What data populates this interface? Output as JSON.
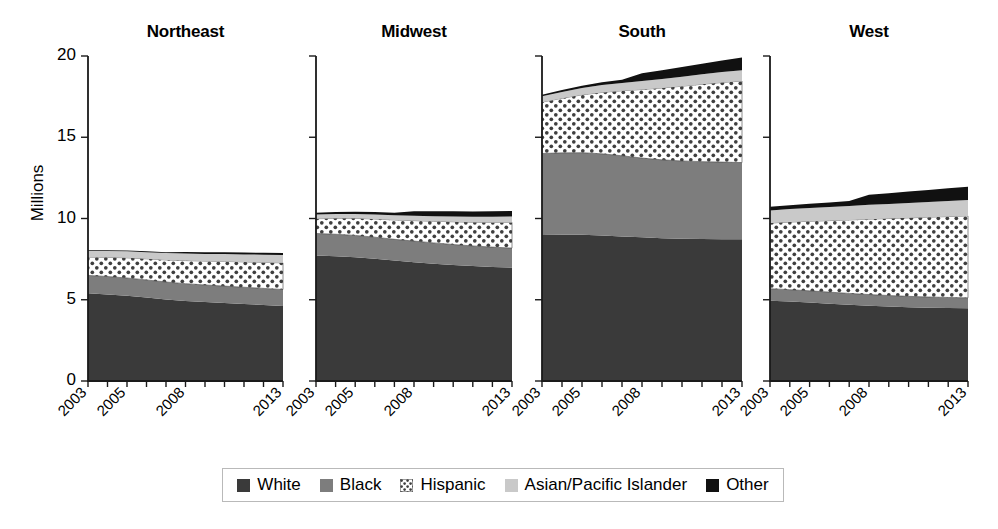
{
  "chart_data": {
    "type": "area",
    "title": "",
    "subtitle": "",
    "xlabel": "",
    "ylabel": "Millions",
    "ylim": [
      0,
      20
    ],
    "yticks": [
      0,
      5,
      10,
      15,
      20
    ],
    "grid": false,
    "legend_position": "bottom",
    "x": [
      2003,
      2004,
      2005,
      2006,
      2007,
      2008,
      2009,
      2010,
      2011,
      2012,
      2013
    ],
    "xtick_labels": [
      "2003",
      "2005",
      "2008",
      "2013"
    ],
    "xtick_label_years": [
      2003,
      2005,
      2008,
      2013
    ],
    "series_names": [
      "White",
      "Black",
      "Hispanic",
      "Asian/Pacific Islander",
      "Other"
    ],
    "series_colors": [
      "#3a3a3a",
      "#7d7d7d",
      "#ffffff",
      "#c9c9c9",
      "#111111"
    ],
    "series_patterns": [
      "solid",
      "solid",
      "dots",
      "solid",
      "solid"
    ],
    "panels": [
      {
        "name": "Northeast",
        "series": [
          {
            "name": "White",
            "values": [
              5.4,
              5.33,
              5.25,
              5.14,
              5.02,
              4.93,
              4.86,
              4.8,
              4.74,
              4.68,
              4.62
            ]
          },
          {
            "name": "Black",
            "values": [
              1.1,
              1.1,
              1.09,
              1.08,
              1.07,
              1.06,
              1.05,
              1.04,
              1.03,
              1.02,
              1.01
            ]
          },
          {
            "name": "Hispanic",
            "values": [
              1.12,
              1.18,
              1.24,
              1.3,
              1.36,
              1.42,
              1.47,
              1.52,
              1.56,
              1.6,
              1.64
            ]
          },
          {
            "name": "Asian/Pacific Islander",
            "values": [
              0.38,
              0.39,
              0.4,
              0.41,
              0.42,
              0.43,
              0.44,
              0.45,
              0.46,
              0.47,
              0.48
            ]
          },
          {
            "name": "Other",
            "values": [
              0.04,
              0.04,
              0.05,
              0.05,
              0.06,
              0.1,
              0.11,
              0.11,
              0.12,
              0.12,
              0.13
            ]
          }
        ],
        "totals": [
          8.04,
          8.04,
          8.03,
          7.98,
          7.93,
          7.94,
          7.93,
          7.92,
          7.91,
          7.89,
          7.88
        ]
      },
      {
        "name": "Midwest",
        "series": [
          {
            "name": "White",
            "values": [
              7.72,
              7.68,
              7.62,
              7.52,
              7.41,
              7.31,
              7.22,
              7.14,
              7.07,
              7.02,
              6.98
            ]
          },
          {
            "name": "Black",
            "values": [
              1.36,
              1.35,
              1.34,
              1.33,
              1.31,
              1.3,
              1.28,
              1.26,
              1.24,
              1.22,
              1.2
            ]
          },
          {
            "name": "Hispanic",
            "values": [
              0.91,
              0.98,
              1.05,
              1.12,
              1.19,
              1.26,
              1.33,
              1.4,
              1.46,
              1.52,
              1.58
            ]
          },
          {
            "name": "Asian/Pacific Islander",
            "values": [
              0.25,
              0.26,
              0.27,
              0.28,
              0.29,
              0.3,
              0.31,
              0.33,
              0.34,
              0.35,
              0.36
            ]
          },
          {
            "name": "Other",
            "values": [
              0.12,
              0.13,
              0.14,
              0.15,
              0.16,
              0.28,
              0.3,
              0.31,
              0.32,
              0.33,
              0.34
            ]
          }
        ],
        "totals": [
          10.36,
          10.4,
          10.42,
          10.4,
          10.36,
          10.45,
          10.44,
          10.44,
          10.43,
          10.44,
          10.46
        ]
      },
      {
        "name": "South",
        "series": [
          {
            "name": "White",
            "values": [
              8.98,
              9.0,
              9.0,
              8.96,
              8.9,
              8.84,
              8.79,
              8.76,
              8.74,
              8.73,
              8.72
            ]
          },
          {
            "name": "Black",
            "values": [
              5.02,
              5.04,
              5.05,
              5.02,
              4.96,
              4.88,
              4.82,
              4.78,
              4.76,
              4.74,
              4.72
            ]
          },
          {
            "name": "Hispanic",
            "values": [
              3.16,
              3.36,
              3.56,
              3.78,
              4.0,
              4.22,
              4.42,
              4.6,
              4.76,
              4.9,
              5.02
            ]
          },
          {
            "name": "Asian/Pacific Islander",
            "values": [
              0.36,
              0.39,
              0.42,
              0.45,
              0.48,
              0.52,
              0.55,
              0.58,
              0.61,
              0.64,
              0.67
            ]
          },
          {
            "name": "Other",
            "values": [
              0.1,
              0.12,
              0.14,
              0.17,
              0.2,
              0.48,
              0.54,
              0.6,
              0.66,
              0.72,
              0.78
            ]
          }
        ],
        "totals": [
          17.62,
          17.91,
          18.17,
          18.38,
          18.54,
          18.94,
          19.12,
          19.32,
          19.53,
          19.73,
          19.91
        ]
      },
      {
        "name": "West",
        "series": [
          {
            "name": "White",
            "values": [
              4.94,
              4.89,
              4.83,
              4.76,
              4.69,
              4.63,
              4.58,
              4.54,
              4.51,
              4.49,
              4.48
            ]
          },
          {
            "name": "Black",
            "values": [
              0.74,
              0.73,
              0.72,
              0.71,
              0.7,
              0.69,
              0.68,
              0.67,
              0.66,
              0.65,
              0.64
            ]
          },
          {
            "name": "Hispanic",
            "values": [
              4.04,
              4.16,
              4.28,
              4.4,
              4.52,
              4.64,
              4.74,
              4.83,
              4.91,
              4.98,
              5.04
            ]
          },
          {
            "name": "Asian/Pacific Islander",
            "values": [
              0.78,
              0.8,
              0.82,
              0.84,
              0.86,
              0.88,
              0.9,
              0.92,
              0.94,
              0.96,
              0.98
            ]
          },
          {
            "name": "Other",
            "values": [
              0.22,
              0.24,
              0.26,
              0.28,
              0.3,
              0.62,
              0.66,
              0.7,
              0.74,
              0.78,
              0.82
            ]
          }
        ],
        "totals": [
          10.72,
          10.82,
          10.91,
          10.99,
          11.07,
          11.46,
          11.56,
          11.66,
          11.76,
          11.86,
          11.96
        ]
      }
    ]
  },
  "axis": {
    "y_label": "Millions",
    "y_ticks": [
      "0",
      "5",
      "10",
      "15",
      "20"
    ],
    "x_ticks": [
      "2003",
      "2005",
      "2008",
      "2013"
    ]
  },
  "panel_titles": [
    "Northeast",
    "Midwest",
    "South",
    "West"
  ],
  "legend": {
    "items": [
      {
        "label": "White",
        "swatch": "swatch-white-series",
        "color": "#3a3a3a",
        "pattern": "solid"
      },
      {
        "label": "Black",
        "swatch": "swatch-black-series",
        "color": "#7d7d7d",
        "pattern": "solid"
      },
      {
        "label": "Hispanic",
        "swatch": "swatch-hispanic-series",
        "color": "#ffffff",
        "pattern": "dots"
      },
      {
        "label": "Asian/Pacific Islander",
        "swatch": "swatch-api-series",
        "color": "#c9c9c9",
        "pattern": "solid"
      },
      {
        "label": "Other",
        "swatch": "swatch-other-series",
        "color": "#111111",
        "pattern": "solid"
      }
    ]
  }
}
